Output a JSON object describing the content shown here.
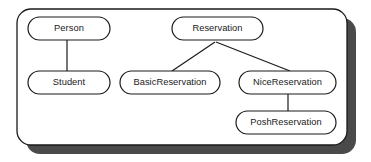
{
  "diagram": {
    "type": "class-hierarchy",
    "title": "",
    "container": {
      "name": "outer-frame",
      "x": 17,
      "y": 9,
      "width": 330,
      "height": 136,
      "radius": 14,
      "fill": "#ffffff",
      "stroke": "#1a1a1a",
      "stroke_width": 1.3,
      "shadow_color": "#4a4a4a",
      "shadow_offset_x": 9,
      "shadow_offset_y": 9
    },
    "node_style": {
      "fill": "#ffffff",
      "stroke": "#1a1a1a",
      "stroke_width": 1.2,
      "radius": 11.5
    },
    "edge_style": {
      "stroke": "#1a1a1a",
      "stroke_width": 1.2
    },
    "nodes": [
      {
        "id": "person",
        "label": "Person",
        "x": 28,
        "y": 17,
        "width": 82,
        "height": 23,
        "cx": 69,
        "cy": 28.5
      },
      {
        "id": "student",
        "label": "Student",
        "x": 28,
        "y": 71,
        "width": 82,
        "height": 23,
        "cx": 69,
        "cy": 82.5
      },
      {
        "id": "reservation",
        "label": "Reservation",
        "x": 172,
        "y": 17,
        "width": 91,
        "height": 23,
        "cx": 217.5,
        "cy": 28.5
      },
      {
        "id": "basic-reservation",
        "label": "BasicReservation",
        "x": 120,
        "y": 71,
        "width": 100,
        "height": 23,
        "cx": 170,
        "cy": 82.5
      },
      {
        "id": "nice-reservation",
        "label": "NiceReservation",
        "x": 239,
        "y": 71,
        "width": 97,
        "height": 23,
        "cx": 287.5,
        "cy": 82.5
      },
      {
        "id": "posh-reservation",
        "label": "PoshReservation",
        "x": 236,
        "y": 111,
        "width": 100,
        "height": 23,
        "cx": 286,
        "cy": 122.5
      }
    ],
    "edges": [
      {
        "id": "person-student",
        "from": "person",
        "to": "student",
        "kind": "vertical",
        "x1": 67,
        "y1": 40,
        "x2": 67,
        "y2": 71
      },
      {
        "id": "reservation-basic",
        "from": "reservation",
        "to": "basic-reservation",
        "kind": "diagonal",
        "x1": 215,
        "y1": 42,
        "x2": 172,
        "y2": 71
      },
      {
        "id": "reservation-nice",
        "from": "reservation",
        "to": "nice-reservation",
        "kind": "diagonal",
        "x1": 216,
        "y1": 42,
        "x2": 290,
        "y2": 71
      },
      {
        "id": "nice-posh",
        "from": "nice-reservation",
        "to": "posh-reservation",
        "kind": "vertical",
        "x1": 288,
        "y1": 94,
        "x2": 288,
        "y2": 111
      }
    ]
  }
}
